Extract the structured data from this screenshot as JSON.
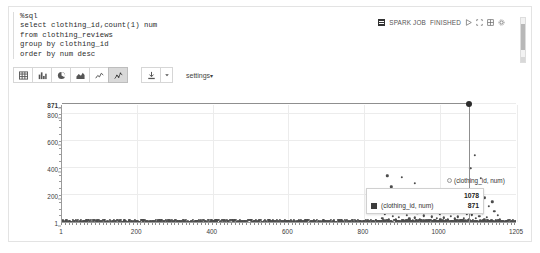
{
  "editor": {
    "code_lines": [
      "%sql",
      "select clothing_id,count(1) num",
      "from clothing_reviews",
      "group by clothing_id",
      "order by num desc"
    ]
  },
  "status_bar": {
    "spark_job_label": "SPARK JOB",
    "state_label": "FINISHED",
    "icons": [
      "spark-job-icon",
      "run-icon",
      "expand-icon",
      "grid-icon",
      "gear-icon"
    ]
  },
  "chart_toolbar": {
    "types": [
      {
        "name": "table",
        "label": "Table",
        "selected": false
      },
      {
        "name": "bar-chart",
        "label": "Bar Chart",
        "selected": false
      },
      {
        "name": "pie-chart",
        "label": "Pie Chart",
        "selected": false
      },
      {
        "name": "area-chart",
        "label": "Area Chart",
        "selected": false
      },
      {
        "name": "line-chart",
        "label": "Line Chart",
        "selected": false
      },
      {
        "name": "scatter-chart",
        "label": "Scatter Chart",
        "selected": true
      }
    ],
    "download_label": "Download",
    "download_caret": "▾",
    "settings_label": "settings",
    "settings_caret": "▾"
  },
  "tooltip": {
    "header": "1078",
    "series_label": "(clothing_id, num)",
    "value": "871"
  },
  "legend": {
    "label": "(clothing_id, num)"
  },
  "chart_data": {
    "type": "scatter",
    "title": "",
    "xlabel": "",
    "ylabel": "",
    "xlim": [
      1,
      1205
    ],
    "ylim": [
      1,
      871
    ],
    "grid": true,
    "legend_position": "top-right",
    "x_ticks": [
      1,
      200,
      400,
      600,
      800,
      1000,
      1205
    ],
    "y_ticks": [
      1,
      200,
      400,
      600,
      800,
      871
    ],
    "series_name": "(clothing_id, num)",
    "highlight": {
      "x": 1078,
      "y": 871,
      "label": "1078"
    },
    "points": [
      [
        1078,
        871
      ],
      [
        1094,
        493
      ],
      [
        862,
        342
      ],
      [
        900,
        330
      ],
      [
        1081,
        398
      ],
      [
        1110,
        323
      ],
      [
        935,
        285
      ],
      [
        1050,
        236
      ],
      [
        970,
        230
      ],
      [
        1020,
        218
      ],
      [
        872,
        262
      ],
      [
        890,
        208
      ],
      [
        1033,
        190
      ],
      [
        1120,
        181
      ],
      [
        829,
        176
      ],
      [
        1005,
        172
      ],
      [
        946,
        166
      ],
      [
        1068,
        160
      ],
      [
        1140,
        152
      ],
      [
        908,
        148
      ],
      [
        860,
        144
      ],
      [
        996,
        140
      ],
      [
        1044,
        136
      ],
      [
        1090,
        131
      ],
      [
        918,
        127
      ],
      [
        1015,
        123
      ],
      [
        1130,
        119
      ],
      [
        880,
        115
      ],
      [
        952,
        111
      ],
      [
        1062,
        107
      ],
      [
        840,
        103
      ],
      [
        1025,
        99
      ],
      [
        1100,
        96
      ],
      [
        963,
        92
      ],
      [
        899,
        89
      ],
      [
        1055,
        86
      ],
      [
        1008,
        83
      ],
      [
        1145,
        80
      ],
      [
        927,
        77
      ],
      [
        869,
        74
      ],
      [
        985,
        72
      ],
      [
        1038,
        69
      ],
      [
        1115,
        66
      ],
      [
        941,
        64
      ],
      [
        1072,
        61
      ],
      [
        855,
        59
      ],
      [
        1000,
        57
      ],
      [
        1086,
        55
      ],
      [
        913,
        52
      ],
      [
        1155,
        50
      ],
      [
        958,
        48
      ],
      [
        1030,
        46
      ],
      [
        876,
        44
      ],
      [
        1105,
        43
      ],
      [
        979,
        41
      ],
      [
        1048,
        39
      ],
      [
        892,
        37
      ],
      [
        1125,
        36
      ],
      [
        1012,
        34
      ],
      [
        934,
        33
      ],
      [
        1065,
        31
      ],
      [
        849,
        30
      ],
      [
        992,
        29
      ],
      [
        1096,
        27
      ],
      [
        920,
        26
      ],
      [
        1040,
        25
      ],
      [
        1160,
        24
      ],
      [
        866,
        23
      ],
      [
        1002,
        22
      ],
      [
        1078,
        21
      ],
      [
        948,
        20
      ],
      [
        1118,
        19
      ],
      [
        884,
        18
      ],
      [
        1022,
        17
      ],
      [
        967,
        16
      ],
      [
        1058,
        15
      ],
      [
        906,
        15
      ],
      [
        1136,
        14
      ],
      [
        1180,
        13
      ],
      [
        832,
        13
      ],
      [
        1070,
        12
      ],
      [
        990,
        12
      ],
      [
        930,
        11
      ],
      [
        1108,
        11
      ],
      [
        858,
        10
      ],
      [
        1045,
        10
      ],
      [
        975,
        9
      ],
      [
        1128,
        9
      ],
      [
        896,
        9
      ],
      [
        1016,
        8
      ],
      [
        1152,
        8
      ],
      [
        942,
        8
      ],
      [
        1088,
        7
      ],
      [
        874,
        7
      ],
      [
        1005,
        7
      ],
      [
        1165,
        6
      ],
      [
        960,
        6
      ],
      [
        1052,
        6
      ],
      [
        910,
        6
      ],
      [
        1175,
        5
      ],
      [
        1098,
        5
      ],
      [
        998,
        5
      ],
      [
        928,
        5
      ],
      [
        846,
        5
      ],
      [
        1190,
        4
      ],
      [
        1060,
        4
      ],
      [
        982,
        4
      ],
      [
        888,
        4
      ],
      [
        1035,
        4
      ],
      [
        1142,
        3
      ],
      [
        952,
        3
      ],
      [
        1075,
        3
      ],
      [
        864,
        3
      ],
      [
        1010,
        3
      ],
      [
        1200,
        2
      ],
      [
        1115,
        2
      ],
      [
        970,
        2
      ],
      [
        902,
        2
      ],
      [
        1028,
        2
      ],
      [
        50,
        2
      ],
      [
        120,
        3
      ],
      [
        185,
        2
      ],
      [
        240,
        4
      ],
      [
        300,
        2
      ],
      [
        355,
        3
      ],
      [
        410,
        5
      ],
      [
        470,
        2
      ],
      [
        520,
        3
      ],
      [
        575,
        4
      ],
      [
        630,
        2
      ],
      [
        680,
        3
      ],
      [
        720,
        5
      ],
      [
        760,
        4
      ],
      [
        790,
        6
      ],
      [
        20,
        1
      ],
      [
        35,
        1
      ],
      [
        60,
        2
      ],
      [
        75,
        1
      ],
      [
        95,
        2
      ],
      [
        110,
        1
      ],
      [
        135,
        2
      ],
      [
        150,
        1
      ],
      [
        165,
        3
      ],
      [
        200,
        1
      ],
      [
        215,
        2
      ],
      [
        230,
        1
      ],
      [
        255,
        2
      ],
      [
        270,
        1
      ],
      [
        285,
        3
      ],
      [
        310,
        1
      ],
      [
        325,
        2
      ],
      [
        340,
        1
      ],
      [
        370,
        2
      ],
      [
        385,
        1
      ],
      [
        395,
        3
      ],
      [
        425,
        1
      ],
      [
        440,
        2
      ],
      [
        455,
        1
      ],
      [
        485,
        2
      ],
      [
        500,
        1
      ],
      [
        510,
        3
      ],
      [
        535,
        1
      ],
      [
        550,
        2
      ],
      [
        565,
        1
      ],
      [
        590,
        2
      ],
      [
        605,
        1
      ],
      [
        615,
        3
      ],
      [
        645,
        1
      ],
      [
        660,
        2
      ],
      [
        670,
        1
      ],
      [
        695,
        2
      ],
      [
        705,
        1
      ],
      [
        735,
        3
      ],
      [
        745,
        1
      ],
      [
        770,
        2
      ],
      [
        780,
        4
      ],
      [
        800,
        8
      ],
      [
        810,
        5
      ],
      [
        820,
        9
      ],
      [
        5,
        1
      ],
      [
        12,
        1
      ],
      [
        28,
        1
      ],
      [
        42,
        1
      ],
      [
        55,
        1
      ],
      [
        68,
        1
      ],
      [
        82,
        1
      ],
      [
        100,
        1
      ],
      [
        115,
        1
      ],
      [
        128,
        1
      ],
      [
        142,
        1
      ],
      [
        158,
        1
      ],
      [
        172,
        1
      ],
      [
        192,
        1
      ],
      [
        208,
        1
      ],
      [
        222,
        1
      ],
      [
        236,
        1
      ],
      [
        248,
        1
      ],
      [
        262,
        1
      ],
      [
        278,
        1
      ],
      [
        292,
        1
      ],
      [
        306,
        1
      ],
      [
        318,
        1
      ],
      [
        332,
        1
      ],
      [
        348,
        1
      ],
      [
        362,
        1
      ],
      [
        378,
        1
      ],
      [
        390,
        1
      ],
      [
        405,
        1
      ],
      [
        418,
        1
      ],
      [
        432,
        1
      ],
      [
        448,
        1
      ],
      [
        462,
        1
      ],
      [
        478,
        1
      ],
      [
        492,
        1
      ],
      [
        505,
        1
      ],
      [
        518,
        1
      ],
      [
        528,
        1
      ],
      [
        542,
        1
      ],
      [
        558,
        1
      ],
      [
        570,
        1
      ],
      [
        582,
        1
      ],
      [
        598,
        1
      ],
      [
        610,
        1
      ],
      [
        622,
        1
      ],
      [
        638,
        1
      ],
      [
        652,
        1
      ],
      [
        665,
        1
      ],
      [
        688,
        1
      ],
      [
        700,
        1
      ],
      [
        712,
        1
      ],
      [
        728,
        1
      ],
      [
        752,
        1
      ],
      [
        765,
        1
      ],
      [
        775,
        1
      ],
      [
        795,
        1
      ],
      [
        805,
        1
      ],
      [
        815,
        1
      ],
      [
        825,
        2
      ],
      [
        838,
        3
      ],
      [
        852,
        2
      ],
      [
        870,
        4
      ],
      [
        885,
        3
      ],
      [
        895,
        5
      ],
      [
        905,
        2
      ],
      [
        915,
        4
      ],
      [
        925,
        3
      ],
      [
        938,
        6
      ],
      [
        950,
        2
      ],
      [
        962,
        4
      ],
      [
        972,
        3
      ],
      [
        986,
        5
      ],
      [
        995,
        2
      ],
      [
        1003,
        4
      ],
      [
        1018,
        3
      ],
      [
        1032,
        6
      ],
      [
        1042,
        2
      ],
      [
        1056,
        4
      ],
      [
        1066,
        3
      ],
      [
        1080,
        5
      ],
      [
        1092,
        2
      ],
      [
        1102,
        4
      ],
      [
        1112,
        3
      ],
      [
        1122,
        5
      ],
      [
        1132,
        2
      ],
      [
        1148,
        3
      ],
      [
        1158,
        2
      ],
      [
        1170,
        1
      ],
      [
        1185,
        1
      ],
      [
        1195,
        1
      ],
      [
        1202,
        1
      ],
      [
        1205,
        1
      ]
    ]
  }
}
